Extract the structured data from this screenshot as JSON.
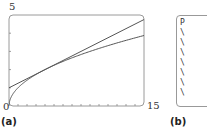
{
  "panel_a": {
    "caption": "(a)",
    "y_max_label": "5",
    "y_min_label": "0",
    "x_max_label": "15"
  },
  "panel_b": {
    "caption": "(b)",
    "first_line": "P",
    "rows": [
      "\\",
      "\\",
      "\\",
      "\\",
      "\\",
      "\\",
      "\\"
    ]
  },
  "chart_data": {
    "type": "line",
    "title": "",
    "xlabel": "",
    "ylabel": "",
    "xlim": [
      0,
      15
    ],
    "ylim": [
      0,
      5
    ],
    "x_ticks": [
      0,
      1,
      2,
      3,
      4,
      5,
      6,
      7,
      8,
      9,
      10,
      11,
      12,
      13,
      14,
      15
    ],
    "y_ticks": [
      0,
      1,
      2,
      3,
      4,
      5
    ],
    "grid": false,
    "series": [
      {
        "name": "y = sqrt(x)",
        "x": [
          0,
          0.25,
          1,
          2,
          4,
          6,
          8,
          10,
          12,
          15
        ],
        "y": [
          0,
          0.5,
          1,
          1.41,
          2,
          2.45,
          2.83,
          3.16,
          3.46,
          3.87
        ]
      },
      {
        "name": "tangent line y = 1 + x/4",
        "x": [
          0,
          15
        ],
        "y": [
          1,
          4.75
        ]
      }
    ],
    "colors": {
      "curve": "#555555",
      "frame": "#999999"
    }
  }
}
